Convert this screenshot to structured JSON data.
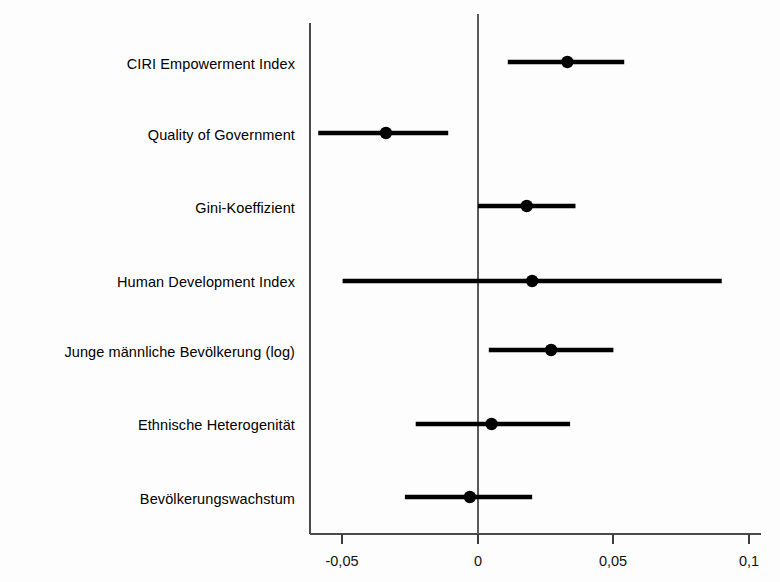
{
  "chart_data": {
    "type": "scatter",
    "subtype": "coefficient-plot",
    "title": "",
    "subtitle": "",
    "xlabel": "",
    "ylabel": "",
    "xlim": [
      -0.062,
      0.108
    ],
    "xticks": [
      -0.05,
      0,
      0.05,
      0.1
    ],
    "xtick_labels": [
      "-0,05",
      "0",
      "0,05",
      "0,1"
    ],
    "grid": false,
    "legend": null,
    "reference_line": 0,
    "decimal_separator": ",",
    "categories": [
      "CIRI Empowerment Index",
      "Quality of Government",
      "Gini-Koeffizient",
      "Human Development Index",
      "Junge männliche Bevölkerung (log)",
      "Ethnische Heterogenität",
      "Bevölkerungswachstum"
    ],
    "points": [
      {
        "label": "CIRI Empowerment Index",
        "estimate": 0.033,
        "ci_low": 0.011,
        "ci_high": 0.054
      },
      {
        "label": "Quality of Government",
        "estimate": -0.034,
        "ci_low": -0.059,
        "ci_high": -0.011
      },
      {
        "label": "Gini-Koeffizient",
        "estimate": 0.018,
        "ci_low": 0.0,
        "ci_high": 0.036
      },
      {
        "label": "Human Development Index",
        "estimate": 0.02,
        "ci_low": -0.05,
        "ci_high": 0.09
      },
      {
        "label": "Junge männliche Bevölkerung (log)",
        "estimate": 0.027,
        "ci_low": 0.004,
        "ci_high": 0.05
      },
      {
        "label": "Ethnische Heterogenität",
        "estimate": 0.005,
        "ci_low": -0.023,
        "ci_high": 0.034
      },
      {
        "label": "Bevölkerungswachstum",
        "estimate": -0.003,
        "ci_low": -0.027,
        "ci_high": 0.02
      }
    ],
    "colors": {
      "marker": "#000000",
      "interval": "#000000",
      "axis": "#4a4a4a",
      "background": "#ffffff"
    }
  },
  "axis": {
    "tick_0": "-0,05",
    "tick_1": "0",
    "tick_2": "0,05",
    "tick_3": "0,1"
  },
  "rows": {
    "r0": "CIRI Empowerment Index",
    "r1": "Quality of Government",
    "r2": "Gini-Koeffizient",
    "r3": "Human Development Index",
    "r4": "Junge männliche Bevölkerung (log)",
    "r5": "Ethnische Heterogenität",
    "r6": "Bevölkerungswachstum"
  }
}
